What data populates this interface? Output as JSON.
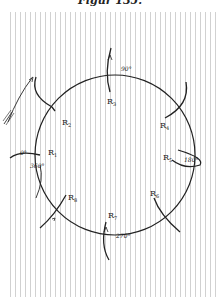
{
  "figure": {
    "title": "Figur 135."
  },
  "diagram": {
    "circle": {
      "cx": 115,
      "cy": 155,
      "r": 80
    },
    "degree_labels": {
      "deg_0": "0°",
      "deg_90": "90°",
      "deg_180": "180°",
      "deg_270": "270°",
      "deg_360": "360°"
    },
    "positions": [
      {
        "id": "R1",
        "label": "R",
        "sub": "1",
        "angle": "0°/360°"
      },
      {
        "id": "R2",
        "label": "R",
        "sub": "2"
      },
      {
        "id": "R3",
        "label": "R",
        "sub": "3",
        "angle": "90°"
      },
      {
        "id": "R4",
        "label": "R",
        "sub": "4"
      },
      {
        "id": "R5",
        "label": "R",
        "sub": "5",
        "angle": "180°"
      },
      {
        "id": "R6",
        "label": "R",
        "sub": "6"
      },
      {
        "id": "R7",
        "label": "R",
        "sub": "7",
        "angle": "270°"
      },
      {
        "id": "R8",
        "label": "R",
        "sub": "8"
      }
    ]
  }
}
